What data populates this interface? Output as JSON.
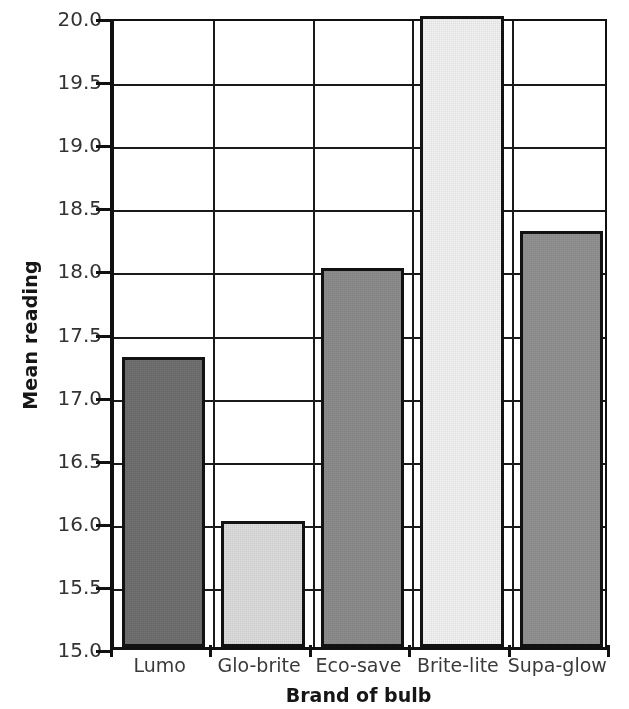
{
  "chart_data": {
    "type": "bar",
    "title": "",
    "subtitle": "",
    "xlabel": "Brand of bulb",
    "ylabel": "Mean reading",
    "categories": [
      "Lumo",
      "Glo-brite",
      "Eco-save",
      "Brite-lite",
      "Supa-glow"
    ],
    "values": [
      17.3,
      16.0,
      18.0,
      20.0,
      18.3
    ],
    "ylim": [
      15.0,
      20.0
    ],
    "ytick_step": 0.5,
    "ytick_labels": [
      "20.0",
      "19.5",
      "19.0",
      "18.5",
      "18.0",
      "17.5",
      "17.0",
      "16.5",
      "16.0",
      "15.5",
      "15.0"
    ],
    "ytick_values": [
      20.0,
      19.5,
      19.0,
      18.5,
      18.0,
      17.5,
      17.0,
      16.5,
      16.0,
      15.5,
      15.0
    ],
    "grid": "horizontal",
    "legend": "none",
    "bar_colors": [
      "#707070",
      "#dcdcdc",
      "#8c8c8c",
      "#f2f2f2",
      "#929292"
    ],
    "bar_edge_color": "#121212",
    "axis_color": "#111111",
    "background_color": "#ffffff"
  }
}
